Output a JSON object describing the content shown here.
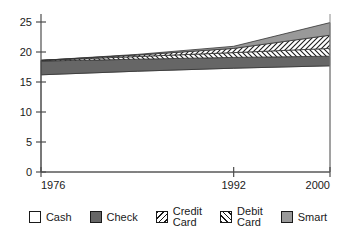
{
  "chart_data": {
    "type": "area",
    "title": "",
    "xlabel": "",
    "ylabel": "",
    "stacked": true,
    "grid": false,
    "legend_position": "bottom",
    "x": [
      1976,
      1984,
      1992,
      2000
    ],
    "xlim": [
      1976,
      2000
    ],
    "ylim": [
      0,
      26
    ],
    "x_ticks": [
      "1976",
      "1992",
      "2000"
    ],
    "x_tick_values": [
      1976,
      1992,
      2000
    ],
    "y_ticks": [
      "0",
      "5",
      "10",
      "15",
      "20",
      "25"
    ],
    "y_tick_values": [
      0,
      5,
      10,
      15,
      20,
      25
    ],
    "series": [
      {
        "name": "Cash",
        "pattern": "solid-white",
        "color": "#ffffff",
        "values": [
          16.2,
          16.8,
          17.3,
          17.7
        ]
      },
      {
        "name": "Check",
        "pattern": "solid-dark-gray",
        "color": "#666666",
        "values": [
          2.3,
          2.0,
          1.8,
          1.6
        ]
      },
      {
        "name": "Credit Card",
        "pattern": "backslash-hatch",
        "color": "#ffffff",
        "values": [
          0.1,
          0.45,
          0.8,
          1.3
        ]
      },
      {
        "name": "Debit Card",
        "pattern": "forwardslash-hatch",
        "color": "#ffffff",
        "values": [
          0.0,
          0.25,
          0.7,
          2.2
        ]
      },
      {
        "name": "Smart",
        "pattern": "solid-mid-gray",
        "color": "#999999",
        "values": [
          0.0,
          0.1,
          0.35,
          2.1
        ]
      }
    ],
    "cumulative_top_values": [
      18.6,
      19.6,
      20.95,
      24.9
    ]
  },
  "legend": {
    "items": [
      {
        "label": "Cash",
        "swatch": "solid-white",
        "color": "#ffffff"
      },
      {
        "label": "Check",
        "swatch": "solid-dark-gray",
        "color": "#666666"
      },
      {
        "label": "Credit\nCard",
        "swatch": "backslash-hatch",
        "color": "#ffffff"
      },
      {
        "label": "Debit\nCard",
        "swatch": "forwardslash-hatch",
        "color": "#ffffff"
      },
      {
        "label": "Smart",
        "swatch": "solid-mid-gray",
        "color": "#999999"
      }
    ]
  },
  "axes": {
    "y_tick_labels": [
      "25",
      "20",
      "15",
      "10",
      "5",
      "0"
    ],
    "x_tick_labels": [
      "1976",
      "1992",
      "2000"
    ]
  },
  "colors": {
    "axis": "#4d4d4d",
    "text": "#1a1a1a",
    "check_fill": "#666666",
    "smart_fill": "#999999",
    "hatch_line": "#1a1a1a",
    "background": "#ffffff"
  }
}
